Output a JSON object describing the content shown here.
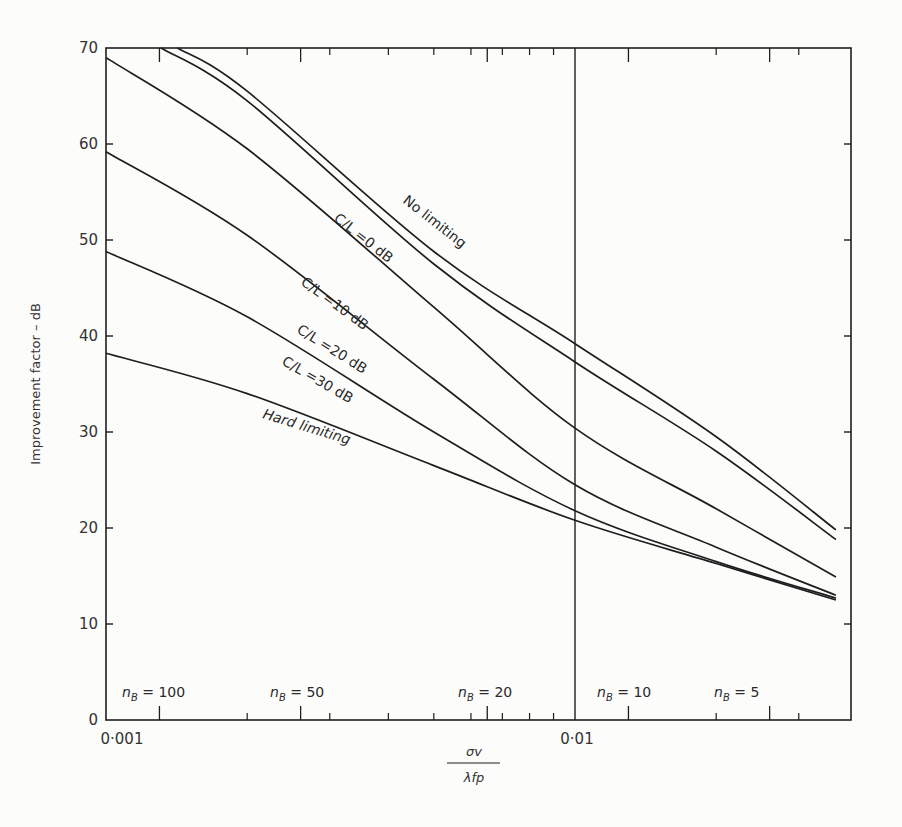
{
  "chart_data": {
    "type": "line",
    "title": "",
    "xlabel": "σv / λfp",
    "xlabel_numerator": "σv",
    "xlabel_denominator": "λfp",
    "ylabel": "Improvement factor – dB",
    "xscale": "log",
    "xlim": [
      0.001,
      0.039
    ],
    "ylim": [
      0,
      70
    ],
    "grid": false,
    "legend": "inline labels on curves",
    "x_tick_labels": [
      {
        "value": 0.001,
        "label": "0·001"
      },
      {
        "value": 0.01,
        "label": "0·01"
      }
    ],
    "y_ticks": [
      0,
      10,
      20,
      30,
      40,
      50,
      60,
      70
    ],
    "vertical_reference_line": 0.01,
    "x": [
      0.001,
      0.002,
      0.005,
      0.01,
      0.02,
      0.036
    ],
    "series": [
      {
        "name": "No limiting",
        "label": "No limiting",
        "start_x": 0.00142,
        "values": [
          null,
          65.5,
          48.8,
          39.2,
          29.5,
          19.8
        ]
      },
      {
        "name": "C/L = 0 dB",
        "label": "C/L =0  dB",
        "start_x": 0.00131,
        "values": [
          null,
          64.5,
          47.5,
          37.3,
          28.0,
          18.8
        ]
      },
      {
        "name": "C/L = 10 dB",
        "label": "C/L =10  dB",
        "values": [
          69.0,
          59.5,
          43.0,
          30.4,
          22.0,
          14.9
        ]
      },
      {
        "name": "C/L = 20 dB",
        "label": "C/L =20  dB",
        "values": [
          59.2,
          50.5,
          35.5,
          24.5,
          18.0,
          13.0
        ]
      },
      {
        "name": "C/L = 30 dB",
        "label": "C/L =30  dB",
        "values": [
          48.8,
          42.0,
          30.0,
          21.8,
          16.5,
          12.7
        ]
      },
      {
        "name": "Hard limiting",
        "label": "Hard limiting",
        "values": [
          38.2,
          34.0,
          26.5,
          20.8,
          16.3,
          12.5
        ]
      }
    ],
    "annotations": [
      {
        "text_n": "n",
        "text_sub": "B",
        "text_eq": " = 100",
        "x": 0.0013
      },
      {
        "text_n": "n",
        "text_sub": "B",
        "text_eq": " = 50",
        "x": 0.0026
      },
      {
        "text_n": "n",
        "text_sub": "B",
        "text_eq": " = 20",
        "x": 0.0065
      },
      {
        "text_n": "n",
        "text_sub": "B",
        "text_eq": " = 10",
        "x": 0.013
      },
      {
        "text_n": "n",
        "text_sub": "B",
        "text_eq": " = 5",
        "x": 0.026
      }
    ]
  },
  "style": {
    "line_color": "#1e1e1e",
    "background": "#fcfcfb"
  }
}
